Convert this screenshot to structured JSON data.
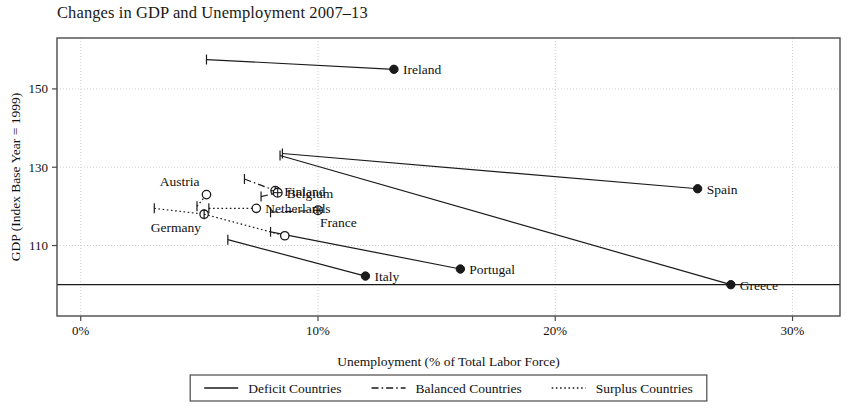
{
  "chart_data": {
    "type": "scatter",
    "title": "Changes in GDP and Unemployment 2007–13",
    "xlabel": "Unemployment (% of Total Labor Force)",
    "ylabel": "GDP (Index Base Year = 1999)",
    "xlim": [
      -1.0,
      32.0
    ],
    "ylim": [
      92,
      163
    ],
    "xticks": [
      0,
      10,
      20,
      30
    ],
    "xticklabels": [
      "0%",
      "10%",
      "20%",
      "30%"
    ],
    "yticks": [
      110,
      130,
      150
    ],
    "yticklabels": [
      "110",
      "130",
      "150"
    ],
    "grid": "dotted light gridlines at ticks",
    "reference_line": {
      "y": 100,
      "style": "solid",
      "note": "GDP index = 100 baseline"
    },
    "legend": {
      "position": "below-plot-centered",
      "entries": [
        {
          "label": "Deficit Countries",
          "style": "solid",
          "marker": "filled-circle"
        },
        {
          "label": "Balanced Countries",
          "style": "dash-dot",
          "marker": "crossed-circle"
        },
        {
          "label": "Surplus Countries",
          "style": "dotted",
          "marker": "open-circle"
        }
      ]
    },
    "series": [
      {
        "name": "Deficit Countries",
        "style": "solid",
        "marker": "filled-circle",
        "points": [
          {
            "country": "Ireland",
            "x_start": 5.3,
            "y_start": 157.5,
            "x_end": 13.2,
            "y_end": 155.0,
            "label": "Ireland",
            "label_side": "right"
          },
          {
            "country": "Spain",
            "x_start": 8.5,
            "y_start": 133.5,
            "x_end": 26.0,
            "y_end": 124.5,
            "label": "Spain",
            "label_side": "right"
          },
          {
            "country": "Greece",
            "x_start": 8.4,
            "y_start": 133.0,
            "x_end": 27.4,
            "y_end": 100.0,
            "label": "Greece",
            "label_side": "right"
          },
          {
            "country": "Portugal",
            "x_start": 8.0,
            "y_start": 113.5,
            "x_end": 16.0,
            "y_end": 104.0,
            "label": "Portugal",
            "label_side": "right"
          },
          {
            "country": "Italy",
            "x_start": 6.2,
            "y_start": 111.5,
            "x_end": 12.0,
            "y_end": 102.2,
            "label": "Italy",
            "label_side": "right"
          }
        ]
      },
      {
        "name": "Balanced Countries",
        "style": "dash-dot",
        "marker": "crossed-circle",
        "points": [
          {
            "country": "Finland",
            "x_start": 6.9,
            "y_start": 127.0,
            "x_end": 8.2,
            "y_end": 124.0,
            "label": "Finland",
            "label_side": "right"
          },
          {
            "country": "Belgium",
            "x_start": 7.6,
            "y_start": 122.5,
            "x_end": 8.3,
            "y_end": 123.5,
            "label": "Belgium",
            "label_side": "right"
          },
          {
            "country": "France",
            "x_start": 8.0,
            "y_start": 118.5,
            "x_end": 10.0,
            "y_end": 119.0,
            "label": "France",
            "label_side": "below"
          }
        ]
      },
      {
        "name": "Surplus Countries",
        "style": "dotted",
        "marker": "open-circle",
        "points": [
          {
            "country": "Austria",
            "x_start": 4.9,
            "y_start": 120.0,
            "x_end": 5.3,
            "y_end": 123.0,
            "label": "Austria",
            "label_side": "above-left"
          },
          {
            "country": "Netherlands",
            "x_start": 5.4,
            "y_start": 119.5,
            "x_end": 7.4,
            "y_end": 119.5,
            "label": "Netherlands",
            "label_side": "right"
          },
          {
            "country": "Germany",
            "x_start": 3.1,
            "y_start": 119.5,
            "x_end": 5.2,
            "y_end": 118.0,
            "label": "Germany",
            "label_side": "below-left"
          },
          {
            "country": "Germany-tail",
            "x_start": 5.2,
            "y_start": 118.0,
            "x_end": 8.6,
            "y_end": 112.5,
            "label": "",
            "label_side": "none"
          }
        ]
      }
    ]
  },
  "colors": {
    "ink": "#1a1a1a",
    "grid": "#cfcfcf",
    "frame": "#4a4a4a",
    "background": "#ffffff"
  }
}
